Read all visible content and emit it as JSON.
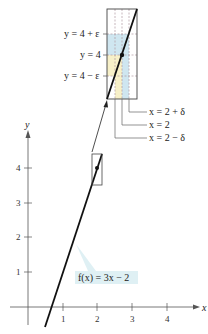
{
  "figure": {
    "function_label": "f(x) = 3x − 2",
    "axes": {
      "x_label": "x",
      "y_label": "y",
      "x_ticks": [
        "1",
        "2",
        "3",
        "4"
      ],
      "y_ticks": [
        "1",
        "2",
        "3",
        "4"
      ]
    },
    "point": {
      "x": 2,
      "y": 4
    },
    "zoom_box": {
      "y_labels": [
        "y = 4 + ε",
        "y = 4",
        "y = 4 − ε"
      ],
      "x_labels": [
        "x = 2 + δ",
        "x = 2",
        "x = 2 − δ"
      ]
    },
    "colors": {
      "line": "#111111",
      "axis": "#555555",
      "epsilon_band": "#cfe6f0",
      "delta_band": "#f7f0c8",
      "label_bg": "#dff0f4"
    }
  }
}
